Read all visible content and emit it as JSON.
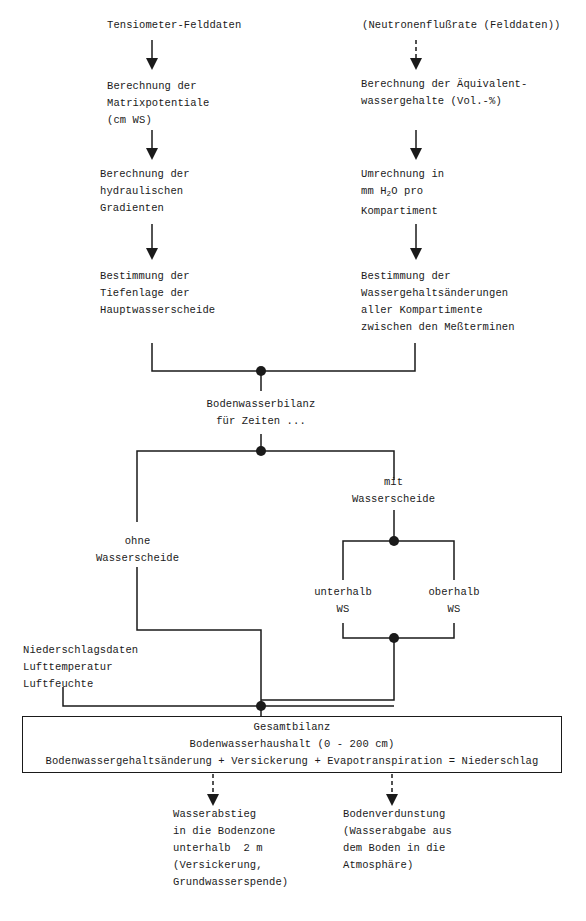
{
  "diagram": {
    "left_column": {
      "source": "Tensiometer-Felddaten",
      "step1": [
        "Berechnung der",
        "Matrixpotentiale",
        "(cm WS)"
      ],
      "step2": [
        "Berechnung der",
        "hydraulischen",
        "Gradienten"
      ],
      "step3": [
        "Bestimmung der",
        "Tiefenlage der",
        "Hauptwasserscheide"
      ]
    },
    "right_column": {
      "source": "(Neutronenflußrate (Felddaten))",
      "step1": [
        "Berechnung der Äquivalent-",
        "wassergehalte (Vol.-%)"
      ],
      "step2": [
        "Umrechnung in",
        "mm H",
        "2",
        "O pro",
        "Kompartiment"
      ],
      "step3": [
        "Bestimmung der",
        "Wassergehaltsänderungen",
        "aller Kompartimente",
        "zwischen den Meßterminen"
      ]
    },
    "merge": [
      "Bodenwasserbilanz",
      "für Zeiten ..."
    ],
    "branch_without": [
      "ohne",
      "Wasserscheide"
    ],
    "branch_with": [
      "mit",
      "Wasserscheide"
    ],
    "sub_below": [
      "unterhalb",
      "WS"
    ],
    "sub_above": [
      "oberhalb",
      "WS"
    ],
    "climate_data": [
      "Niederschlagsdaten",
      "Lufttemperatur",
      "Luftfeuchte"
    ],
    "total_box": {
      "title": "Gesamtbilanz",
      "subtitle": "Bodenwasserhaushalt (0 - 200 cm)",
      "equation": "Bodenwassergehaltsänderung + Versickerung + Evapotranspiration = Niederschlag"
    },
    "output_left": [
      "Wasserabstieg",
      "in die Bodenzone",
      "unterhalb  2 m",
      "(Versickerung,",
      "Grundwasserspende)"
    ],
    "output_right": [
      "Bodenverdunstung",
      "(Wasserabgabe aus",
      "dem Boden in die",
      "Atmosphäre)"
    ],
    "colors": {
      "line": "#1a1a1a",
      "background": "#ffffff"
    }
  }
}
